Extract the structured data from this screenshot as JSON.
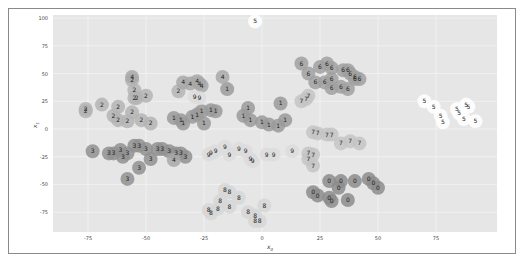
{
  "chart_data": {
    "type": "scatter",
    "title": "",
    "xlabel": "x0",
    "ylabel": "x1",
    "xlim": [
      -90,
      100
    ],
    "ylim": [
      -90,
      100
    ],
    "xticks": [
      -75,
      -50,
      -25,
      0,
      25,
      50,
      75
    ],
    "yticks": [
      -75,
      -50,
      -25,
      0,
      25,
      50,
      75,
      100
    ],
    "grid": true,
    "legend": null,
    "clusters": [
      {
        "label": "0",
        "shade": "#8c8c8c",
        "center": [
          42,
          -57
        ],
        "points": [
          [
            22,
            -57
          ],
          [
            24,
            -60
          ],
          [
            29,
            -47
          ],
          [
            34,
            -47
          ],
          [
            33,
            -53
          ],
          [
            40,
            -47
          ],
          [
            46,
            -45
          ],
          [
            48,
            -49
          ],
          [
            50,
            -53
          ],
          [
            37,
            -64
          ],
          [
            30,
            -65
          ],
          [
            29,
            -62
          ]
        ]
      },
      {
        "label": "1",
        "shade": "#9a9a9a",
        "center": [
          -5,
          12
        ],
        "points": [
          [
            -38,
            10
          ],
          [
            -35,
            8
          ],
          [
            -30,
            11
          ],
          [
            -28,
            13
          ],
          [
            -26,
            16
          ],
          [
            -22,
            17
          ],
          [
            -20,
            16
          ],
          [
            -25,
            5
          ],
          [
            -34,
            5
          ],
          [
            -8,
            12
          ],
          [
            -5,
            8
          ],
          [
            0,
            6
          ],
          [
            3,
            4
          ],
          [
            7,
            3
          ],
          [
            10,
            8
          ],
          [
            -6,
            19
          ],
          [
            -15,
            36
          ],
          [
            8,
            23
          ]
        ]
      },
      {
        "label": "2",
        "shade": "#b4b4b4",
        "center": [
          -60,
          20
        ],
        "points": [
          [
            -76,
            18
          ],
          [
            -76,
            16
          ],
          [
            -69,
            22
          ],
          [
            -62,
            20
          ],
          [
            -64,
            12
          ],
          [
            -62,
            8
          ],
          [
            -58,
            7
          ],
          [
            -52,
            8
          ],
          [
            -56,
            15
          ],
          [
            -55,
            28
          ],
          [
            -54,
            28
          ],
          [
            -55,
            35
          ],
          [
            -50,
            30
          ],
          [
            -56,
            44
          ],
          [
            -36,
            34
          ],
          [
            -48,
            5
          ]
        ]
      },
      {
        "label": "3",
        "shade": "#909090",
        "center": [
          -60,
          -28
        ],
        "points": [
          [
            -73,
            -20
          ],
          [
            -66,
            -22
          ],
          [
            -64,
            -22
          ],
          [
            -61,
            -19
          ],
          [
            -58,
            -22
          ],
          [
            -55,
            -15
          ],
          [
            -53,
            -15
          ],
          [
            -50,
            -18
          ],
          [
            -45,
            -18
          ],
          [
            -43,
            -18
          ],
          [
            -40,
            -20
          ],
          [
            -37,
            -22
          ],
          [
            -35,
            -22
          ],
          [
            -33,
            -25
          ],
          [
            -60,
            -25
          ],
          [
            -53,
            -35
          ],
          [
            -48,
            -27
          ],
          [
            -58,
            -45
          ]
        ]
      },
      {
        "label": "4",
        "shade": "#a8a8a8",
        "center": [
          -27,
          40
        ],
        "points": [
          [
            -34,
            42
          ],
          [
            -31,
            41
          ],
          [
            -28,
            43
          ],
          [
            -27,
            41
          ],
          [
            -26,
            39
          ],
          [
            -17,
            47
          ],
          [
            -56,
            47
          ],
          [
            -38,
            -28
          ]
        ]
      },
      {
        "label": "5",
        "shade": "#ffffff",
        "center": [
          80,
          17
        ],
        "points": [
          [
            -3,
            97
          ],
          [
            70,
            25
          ],
          [
            74,
            20
          ],
          [
            77,
            12
          ],
          [
            78,
            6
          ],
          [
            84,
            18
          ],
          [
            85,
            14
          ],
          [
            88,
            22
          ],
          [
            89,
            20
          ],
          [
            87,
            9
          ],
          [
            92,
            7
          ]
        ]
      },
      {
        "label": "6",
        "shade": "#a0a0a0",
        "center": [
          30,
          52
        ],
        "points": [
          [
            20,
            50
          ],
          [
            25,
            56
          ],
          [
            28,
            59
          ],
          [
            30,
            55
          ],
          [
            35,
            53
          ],
          [
            37,
            53
          ],
          [
            38,
            50
          ],
          [
            40,
            45
          ],
          [
            40,
            47
          ],
          [
            42,
            45
          ],
          [
            30,
            45
          ],
          [
            23,
            42
          ],
          [
            27,
            42
          ],
          [
            30,
            37
          ],
          [
            34,
            38
          ],
          [
            37,
            36
          ],
          [
            17,
            59
          ]
        ]
      },
      {
        "label": "7",
        "shade": "#c4c4c4",
        "center": [
          33,
          -4
        ],
        "points": [
          [
            17,
            25
          ],
          [
            19,
            27
          ],
          [
            20,
            30
          ],
          [
            22,
            -3
          ],
          [
            24,
            -4
          ],
          [
            28,
            -5
          ],
          [
            30,
            -5
          ],
          [
            34,
            -13
          ],
          [
            38,
            -11
          ],
          [
            42,
            -13
          ],
          [
            20,
            -22
          ],
          [
            22,
            -23
          ],
          [
            20,
            -27
          ],
          [
            22,
            -33
          ]
        ]
      },
      {
        "label": "8",
        "shade": "#d6d6d6",
        "center": [
          -8,
          -62
        ],
        "points": [
          [
            -16,
            -55
          ],
          [
            -14,
            -57
          ],
          [
            -18,
            -65
          ],
          [
            -19,
            -72
          ],
          [
            -23,
            -73
          ],
          [
            -22,
            -76
          ],
          [
            -14,
            -70
          ],
          [
            -10,
            -62
          ],
          [
            -6,
            -75
          ],
          [
            -3,
            -78
          ],
          [
            1,
            -69
          ],
          [
            -3,
            -83
          ],
          [
            -1,
            -83
          ]
        ]
      },
      {
        "label": "9",
        "shade": "#dcdcdc",
        "center": [
          0,
          -22
        ],
        "points": [
          [
            -29,
            29
          ],
          [
            -27,
            28
          ],
          [
            -16,
            -16
          ],
          [
            -14,
            -23
          ],
          [
            -10,
            -18
          ],
          [
            -7,
            -20
          ],
          [
            -5,
            -27
          ],
          [
            -4,
            -29
          ],
          [
            2,
            -23
          ],
          [
            5,
            -23
          ],
          [
            13,
            -20
          ],
          [
            -20,
            -20
          ],
          [
            -22,
            -22
          ],
          [
            -23,
            -23
          ]
        ]
      }
    ]
  }
}
